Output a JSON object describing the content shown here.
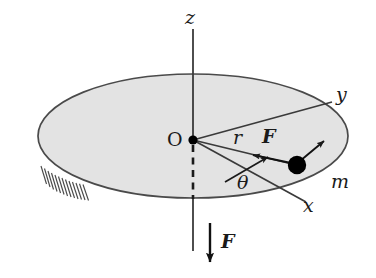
{
  "figure": {
    "type": "physics-free-body-diagram",
    "width": 376,
    "height": 278,
    "background_color": "#ffffff"
  },
  "colors": {
    "stroke": "#3a3a3a",
    "disk_fill": "#e3e3e3",
    "disk_edge": "#4a4a4a",
    "mass_fill": "#000000",
    "text": "#1a1a1a",
    "hatch": "#4a4a4a"
  },
  "labels": {
    "z_axis": "z",
    "y_axis": "y",
    "x_axis": "x",
    "origin": "O",
    "radius": "r",
    "force_in_plane": "F",
    "force_vertical": "F",
    "angle": "θ",
    "mass": "m"
  },
  "elements": {
    "disk": {
      "name": "horizontal-disk",
      "center": [
        193,
        136
      ],
      "rx": 155,
      "ry": 62,
      "fill": "#e3e3e3",
      "stroke": "#4a4a4a"
    },
    "origin_point": {
      "name": "origin-dot",
      "position": [
        193,
        140
      ],
      "radius": 4.5
    },
    "mass_particle": {
      "name": "mass-particle",
      "position": [
        297,
        165
      ],
      "radius": 9,
      "label": "m"
    },
    "z_axis_line": {
      "from": [
        193,
        30
      ],
      "to": [
        193,
        250
      ]
    },
    "y_axis_line": {
      "from": [
        193,
        140
      ],
      "to": [
        331,
        103
      ]
    },
    "x_axis_line": {
      "from": [
        193,
        140
      ],
      "to": [
        305,
        201
      ]
    },
    "radius_line": {
      "from": [
        193,
        140
      ],
      "to": [
        297,
        165
      ]
    },
    "dashed_segment": {
      "from": [
        193,
        144
      ],
      "to": [
        193,
        199
      ]
    },
    "force_in_plane_arrow": {
      "from": [
        290,
        163
      ],
      "to": [
        256,
        156
      ],
      "direction": "toward-center"
    },
    "velocity_arrow": {
      "from": [
        300,
        162
      ],
      "to": [
        323,
        142
      ],
      "direction": "tangential"
    },
    "theta_arc_arrow": {
      "from": [
        226,
        181
      ],
      "to": [
        265,
        158
      ]
    },
    "force_vertical_arrow": {
      "from": [
        210,
        224
      ],
      "to": [
        210,
        260
      ],
      "direction": "downward"
    },
    "hatching": {
      "name": "fixed-support-hatching",
      "count": 13,
      "region": [
        40,
        168,
        76,
        198
      ]
    }
  },
  "label_positions": {
    "z": [
      186,
      8
    ],
    "y": [
      337,
      86
    ],
    "x": [
      303,
      196
    ],
    "O": [
      168,
      130
    ],
    "r": [
      233,
      128
    ],
    "F_plane": [
      263,
      128
    ],
    "theta": [
      237,
      173
    ],
    "m": [
      333,
      173
    ],
    "F_vertical": [
      222,
      233
    ]
  }
}
